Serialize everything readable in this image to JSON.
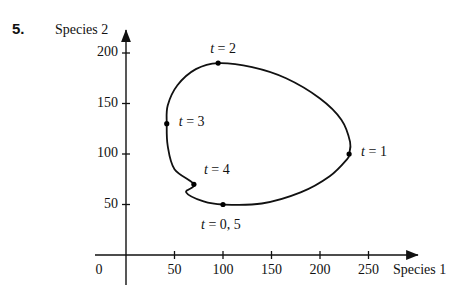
{
  "problem": {
    "number": "5."
  },
  "axes": {
    "ylabel": "Species 2",
    "xlabel": "Species 1",
    "origin_label": "0",
    "xticks": [
      {
        "value": 50,
        "label": "50"
      },
      {
        "value": 100,
        "label": "100"
      },
      {
        "value": 150,
        "label": "150"
      },
      {
        "value": 200,
        "label": "200"
      },
      {
        "value": 250,
        "label": "250"
      }
    ],
    "yticks": [
      {
        "value": 50,
        "label": "50"
      },
      {
        "value": 100,
        "label": "100"
      },
      {
        "value": 150,
        "label": "150"
      },
      {
        "value": 200,
        "label": "200"
      }
    ]
  },
  "chart_data": {
    "type": "line",
    "title": "",
    "xlabel": "Species 1",
    "ylabel": "Species 2",
    "xlim": [
      0,
      270
    ],
    "ylim": [
      0,
      215
    ],
    "grid": false,
    "legend": "none",
    "closed_curve": true,
    "annotations": [
      {
        "label": "t = 2",
        "t": 2,
        "x": 95,
        "y": 190,
        "label_dx": -8,
        "label_dy": -22
      },
      {
        "label": "t = 3",
        "t": 3,
        "x": 42,
        "y": 130,
        "label_dx": 12,
        "label_dy": -10
      },
      {
        "label": "t = 4",
        "t": 4,
        "x": 70,
        "y": 70,
        "label_dx": 10,
        "label_dy": -22
      },
      {
        "label": "t = 0, 5",
        "t": 0,
        "x": 100,
        "y": 50,
        "label_dx": -22,
        "label_dy": 12
      },
      {
        "label": "t = 1",
        "t": 1,
        "x": 230,
        "y": 100,
        "label_dx": 12,
        "label_dy": -10
      }
    ],
    "curve_points": [
      {
        "x": 100,
        "y": 50
      },
      {
        "x": 140,
        "y": 51
      },
      {
        "x": 180,
        "y": 62
      },
      {
        "x": 210,
        "y": 78
      },
      {
        "x": 228,
        "y": 95
      },
      {
        "x": 230,
        "y": 100
      },
      {
        "x": 231,
        "y": 112
      },
      {
        "x": 222,
        "y": 134
      },
      {
        "x": 200,
        "y": 155
      },
      {
        "x": 165,
        "y": 175
      },
      {
        "x": 130,
        "y": 186
      },
      {
        "x": 95,
        "y": 190
      },
      {
        "x": 72,
        "y": 184
      },
      {
        "x": 53,
        "y": 168
      },
      {
        "x": 43,
        "y": 148
      },
      {
        "x": 42,
        "y": 130
      },
      {
        "x": 43,
        "y": 108
      },
      {
        "x": 50,
        "y": 85
      },
      {
        "x": 70,
        "y": 70
      },
      {
        "x": 62,
        "y": 62
      },
      {
        "x": 80,
        "y": 53
      },
      {
        "x": 100,
        "y": 50
      }
    ]
  },
  "colors": {
    "curve": "#111111",
    "axis": "#111111",
    "point": "#000000",
    "background": "#ffffff"
  }
}
